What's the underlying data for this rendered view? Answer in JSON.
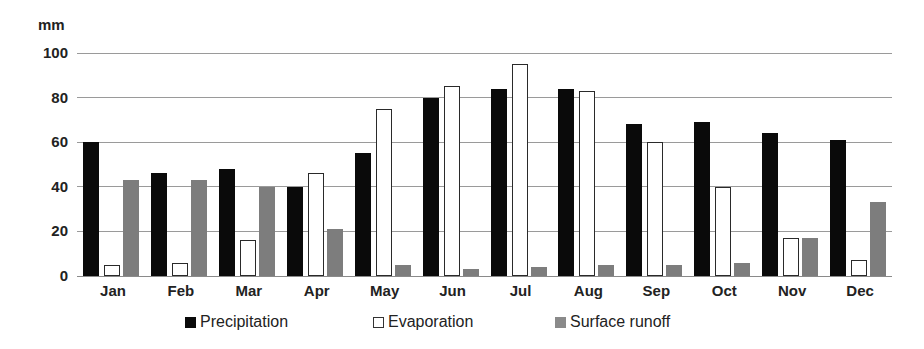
{
  "chart_data": {
    "type": "bar",
    "title": "",
    "xlabel": "",
    "ylabel": "mm",
    "ylim": [
      0,
      100
    ],
    "yticks": [
      0,
      20,
      40,
      60,
      80,
      100
    ],
    "grid": true,
    "legend_position": "bottom",
    "categories": [
      "Jan",
      "Feb",
      "Mar",
      "Apr",
      "May",
      "Jun",
      "Jul",
      "Aug",
      "Sep",
      "Oct",
      "Nov",
      "Dec"
    ],
    "series": [
      {
        "name": "Precipitation",
        "color": "#0a0a0a",
        "style": "solid",
        "values": [
          60,
          46,
          48,
          40,
          55,
          80,
          84,
          84,
          68,
          69,
          64,
          61
        ]
      },
      {
        "name": "Evaporation",
        "color": "#ffffff",
        "style": "outline",
        "values": [
          5,
          6,
          16,
          46,
          75,
          85,
          95,
          83,
          60,
          40,
          17,
          7
        ]
      },
      {
        "name": "Surface runoff",
        "color": "#7d7d7d",
        "style": "solid",
        "values": [
          43,
          43,
          40,
          21,
          5,
          3,
          4,
          5,
          5,
          6,
          17,
          33
        ]
      }
    ]
  },
  "axis": {
    "unit_label": "mm",
    "ytick_labels": [
      "100",
      "80",
      "60",
      "40",
      "20",
      "0"
    ]
  },
  "legend": {
    "items": [
      {
        "label": "Precipitation"
      },
      {
        "label": "Evaporation"
      },
      {
        "label": "Surface runoff"
      }
    ]
  }
}
